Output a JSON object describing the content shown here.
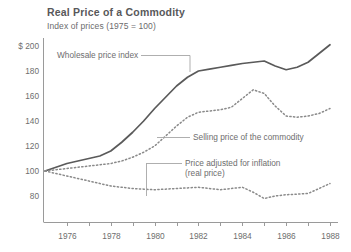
{
  "header": {
    "title": "Real Price of a Commodity",
    "subtitle": "Index of prices (1975 = 100)"
  },
  "chart_data": {
    "type": "line",
    "title": "Real Price of a Commodity",
    "subtitle": "Index of prices (1975 = 100)",
    "xlabel": "",
    "ylabel": "",
    "xlim": [
      1975,
      1988
    ],
    "ylim": [
      72,
      205
    ],
    "grid": false,
    "legend_position": "inline-annotations",
    "y_ticks": [
      {
        "value": 200,
        "label": "$ 200"
      },
      {
        "value": 180,
        "label": "180"
      },
      {
        "value": 160,
        "label": "160"
      },
      {
        "value": 140,
        "label": "140"
      },
      {
        "value": 120,
        "label": "120"
      },
      {
        "value": 100,
        "label": "100"
      },
      {
        "value": 80,
        "label": "80"
      }
    ],
    "x_ticks": [
      {
        "value": 1976,
        "label": "1976"
      },
      {
        "value": 1977,
        "label": ""
      },
      {
        "value": 1978,
        "label": "1978"
      },
      {
        "value": 1979,
        "label": ""
      },
      {
        "value": 1980,
        "label": "1980"
      },
      {
        "value": 1981,
        "label": ""
      },
      {
        "value": 1982,
        "label": "1982"
      },
      {
        "value": 1983,
        "label": ""
      },
      {
        "value": 1984,
        "label": "1984"
      },
      {
        "value": 1985,
        "label": ""
      },
      {
        "value": 1986,
        "label": "1986"
      },
      {
        "value": 1987,
        "label": ""
      },
      {
        "value": 1988,
        "label": "1988"
      }
    ],
    "x": [
      1975,
      1975.5,
      1976,
      1976.5,
      1977,
      1977.5,
      1978,
      1978.5,
      1979,
      1979.5,
      1980,
      1980.5,
      1981,
      1981.5,
      1982,
      1982.5,
      1983,
      1983.5,
      1984,
      1984.5,
      1985,
      1985.5,
      1986,
      1986.5,
      1987,
      1987.5,
      1988
    ],
    "series": [
      {
        "name": "Wholesale price index",
        "style": "solid",
        "color": "#5a5a5a",
        "values": [
          100,
          103,
          106,
          108,
          110,
          112,
          116,
          123,
          131,
          140,
          150,
          159,
          168,
          175,
          180,
          181.5,
          183,
          184.5,
          186,
          187,
          188,
          184,
          181,
          183,
          187,
          194,
          201
        ]
      },
      {
        "name": "Selling price of the commodity",
        "style": "dotted",
        "color": "#8a8a8a",
        "values": [
          100,
          101,
          102,
          103,
          104,
          105,
          106,
          108,
          111,
          115,
          120,
          128,
          136,
          143,
          147,
          148,
          149,
          151,
          158,
          165,
          162,
          152,
          144,
          143,
          144,
          146,
          150
        ]
      },
      {
        "name": "Price adjusted for inflation (real price)",
        "style": "dotted",
        "color": "#8a8a8a",
        "values": [
          100,
          98,
          96,
          94,
          92,
          90,
          88,
          87,
          86,
          85.5,
          85,
          85.5,
          86,
          86.5,
          87,
          86,
          85,
          86,
          87,
          83,
          78,
          80,
          81,
          81.5,
          82,
          86,
          90
        ]
      }
    ],
    "annotations": [
      {
        "text": "Wholesale price index",
        "x": 57,
        "y": 58
      },
      {
        "text": "Selling price of the commodity",
        "x": 193,
        "y": 140
      },
      {
        "text": "Price adjusted for inflation",
        "x": 185,
        "y": 166
      },
      {
        "text": "(real price)",
        "x": 185,
        "y": 176
      }
    ]
  },
  "axis_title_prefix": "$ "
}
